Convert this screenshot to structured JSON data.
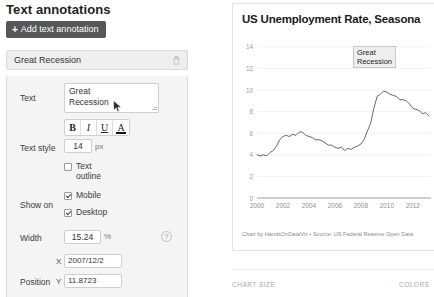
{
  "panel": {
    "title": "Text annotations",
    "add_button": {
      "label": "Add text annotation",
      "icon": "plus-icon"
    },
    "annotation_items": [
      {
        "label": "Great Recession",
        "delete_icon": "trash-icon"
      }
    ],
    "fields": {
      "text": {
        "label": "Text",
        "value": "Great Recession",
        "line1": "Great",
        "line2": "Recession"
      },
      "text_style": {
        "label": "Text style",
        "bold_label": "B",
        "italic_label": "I",
        "underline_label": "U",
        "color_label": "A",
        "size_value": "14",
        "size_unit": "px",
        "text_outline_label": "Text outline",
        "text_outline_checked": false
      },
      "show_on": {
        "label": "Show on",
        "options": [
          {
            "label": "Mobile",
            "checked": true
          },
          {
            "label": "Desktop",
            "checked": true
          }
        ]
      },
      "width": {
        "label": "Width",
        "value": "15.24",
        "unit": "%",
        "help_icon": "question-mark-icon",
        "help_label": "?"
      },
      "position": {
        "label": "Position",
        "x_prefix": "X",
        "x_value": "2007/12/2",
        "y_prefix": "Y",
        "y_value": "11.8723"
      }
    }
  },
  "chart_panel": {
    "footer": "Chart by HandsOnDataViz • Source: US Federal Reserve Open Data",
    "annotation_on_chart": {
      "line1": "Great",
      "line2": "Recession"
    }
  },
  "bottom": {
    "chart_size_label": "CHART SIZE",
    "colors_label": "COLORS"
  },
  "chart_data": {
    "type": "line",
    "title": "US Unemployment Rate, Seasona",
    "title_full": "US Unemployment Rate, Seasonally Adjusted",
    "xlabel": "",
    "ylabel": "",
    "ylim": [
      0,
      15
    ],
    "xlim": [
      2000,
      2013.4
    ],
    "yticks": [
      0,
      2,
      4,
      6,
      8,
      10,
      12,
      14
    ],
    "xticks": [
      2000,
      2002,
      2004,
      2006,
      2008,
      2010,
      2012
    ],
    "grid": true,
    "legend": false,
    "line_color": "#555555",
    "annotations": [
      {
        "text": "Great Recession",
        "x": "2007/12/2",
        "y": 11.8723
      }
    ],
    "series": [
      {
        "name": "Unemployment Rate",
        "x": [
          2000.0,
          2000.25,
          2000.5,
          2000.75,
          2001.0,
          2001.25,
          2001.5,
          2001.75,
          2002.0,
          2002.25,
          2002.5,
          2002.75,
          2003.0,
          2003.25,
          2003.5,
          2003.75,
          2004.0,
          2004.25,
          2004.5,
          2004.75,
          2005.0,
          2005.25,
          2005.5,
          2005.75,
          2006.0,
          2006.25,
          2006.5,
          2006.75,
          2007.0,
          2007.25,
          2007.5,
          2007.75,
          2008.0,
          2008.25,
          2008.5,
          2008.75,
          2009.0,
          2009.25,
          2009.5,
          2009.75,
          2010.0,
          2010.25,
          2010.5,
          2010.75,
          2011.0,
          2011.25,
          2011.5,
          2011.75,
          2012.0,
          2012.25,
          2012.5,
          2012.75,
          2013.0,
          2013.25
        ],
        "values": [
          4.0,
          3.9,
          4.0,
          3.9,
          4.2,
          4.4,
          4.8,
          5.4,
          5.7,
          5.8,
          5.7,
          5.9,
          5.8,
          6.1,
          6.1,
          5.8,
          5.7,
          5.6,
          5.4,
          5.4,
          5.3,
          5.1,
          4.9,
          4.9,
          4.7,
          4.6,
          4.7,
          4.4,
          4.6,
          4.5,
          4.7,
          4.8,
          5.0,
          5.4,
          6.2,
          6.9,
          8.3,
          9.4,
          9.6,
          9.9,
          9.8,
          9.6,
          9.5,
          9.4,
          9.1,
          9.1,
          9.0,
          8.7,
          8.3,
          8.2,
          8.1,
          7.8,
          7.9,
          7.6
        ]
      }
    ]
  }
}
